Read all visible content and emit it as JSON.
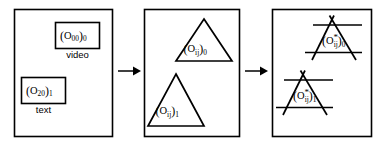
{
  "figure": {
    "background_color": "#ffffff",
    "stroke_color": "#000000"
  },
  "panels": [
    {
      "id": "panel-1",
      "name": "source-objects-panel",
      "items": [
        {
          "shape": "rectangle",
          "label_base": "O",
          "label_index": "00",
          "label_layer": "0",
          "label_text": "(O00)0",
          "media_label": "video"
        },
        {
          "shape": "rectangle",
          "label_base": "O",
          "label_index": "20",
          "label_layer": "1",
          "label_text": "(O20)1",
          "media_label": "text"
        }
      ]
    },
    {
      "id": "panel-2",
      "name": "generalized-objects-panel",
      "items": [
        {
          "shape": "triangle",
          "label_base": "O",
          "label_index": "ij",
          "label_layer": "0",
          "label_text": "(Oij)0",
          "media_label": ""
        },
        {
          "shape": "triangle",
          "label_base": "O",
          "label_index": "ij",
          "label_layer": "1",
          "label_text": "(Oij)1",
          "media_label": ""
        }
      ]
    },
    {
      "id": "panel-3",
      "name": "transformed-objects-panel",
      "items": [
        {
          "shape": "triangle-extended",
          "label_base": "O",
          "label_star": "*",
          "label_index": "ij",
          "label_layer": "0",
          "label_text": "(O*ij)0",
          "media_label": ""
        },
        {
          "shape": "triangle-extended",
          "label_base": "O",
          "label_star": "*",
          "label_index": "ij",
          "label_layer": "1",
          "label_text": "(O*ij)1",
          "media_label": ""
        }
      ]
    }
  ],
  "arrows": [
    {
      "id": "arrow-1",
      "name": "arrow-panel1-to-panel2",
      "direction": "right"
    },
    {
      "id": "arrow-2",
      "name": "arrow-panel2-to-panel3",
      "direction": "right"
    }
  ],
  "labels": {
    "o_base": "O",
    "star": "*",
    "idx_00": "00",
    "idx_20": "20",
    "idx_ij": "ij",
    "layer_0": "0",
    "layer_1": "1",
    "open_paren": "(",
    "close_paren": ")",
    "media_video": "video",
    "media_text": "text"
  }
}
